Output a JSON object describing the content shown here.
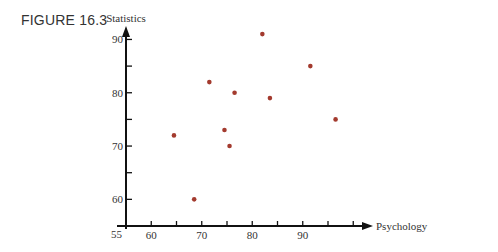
{
  "figure_label": "FIGURE 16.3",
  "chart_data": {
    "type": "scatter",
    "title": "",
    "xlabel": "Psychology",
    "ylabel": "Statistics",
    "xlim": [
      55,
      100
    ],
    "ylim": [
      55,
      92
    ],
    "grid": false,
    "legend": null,
    "x_ticks": [
      60,
      65,
      70,
      75,
      80,
      85,
      90,
      95,
      100
    ],
    "x_tick_labels": [
      "60",
      "70",
      "80",
      "90"
    ],
    "y_ticks": [
      60,
      65,
      70,
      75,
      80,
      85,
      90
    ],
    "y_tick_labels": [
      "60",
      "70",
      "80",
      "90"
    ],
    "origin_label": "55",
    "point_color": "#a33a2e",
    "points": [
      {
        "x": 64.5,
        "y": 72
      },
      {
        "x": 68.5,
        "y": 60
      },
      {
        "x": 71.5,
        "y": 82
      },
      {
        "x": 74.5,
        "y": 73
      },
      {
        "x": 75.5,
        "y": 70
      },
      {
        "x": 76.5,
        "y": 80
      },
      {
        "x": 82,
        "y": 91
      },
      {
        "x": 83.5,
        "y": 79
      },
      {
        "x": 91.5,
        "y": 85
      },
      {
        "x": 96.5,
        "y": 75
      }
    ]
  }
}
